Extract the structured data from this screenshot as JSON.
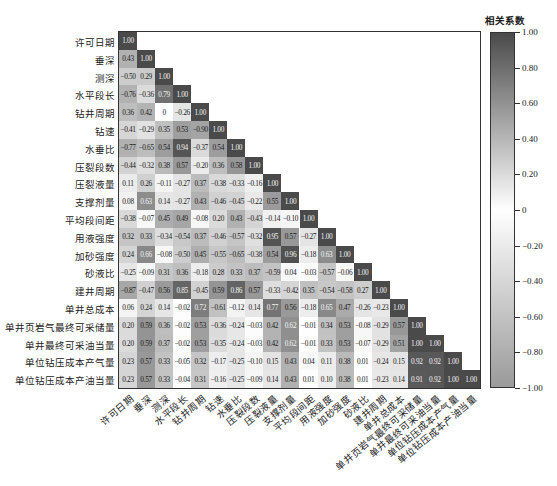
{
  "chart_data": {
    "type": "heatmap",
    "title": "",
    "colorbar_label": "相关系数",
    "colorbar_ticks": [
      "1.00",
      "0.80",
      "0.60",
      "0.40",
      "0.20",
      "0",
      "-0.20",
      "-0.40",
      "-0.60",
      "-0.80",
      "-1.00"
    ],
    "vmin": -1.0,
    "vmax": 1.0,
    "triangle": "lower",
    "variables": [
      "许可日期",
      "垂深",
      "测深",
      "水平段长",
      "钻井周期",
      "钻速",
      "水垂比",
      "压裂段数",
      "压裂液量",
      "支撑剂量",
      "平均段间距",
      "用液强度",
      "加砂强度",
      "砂液比",
      "建井周期",
      "单井总成本",
      "单井页岩气最终可采储量",
      "单井最终可采油当量",
      "单位钻压成本产气量",
      "单位钻压成本产油当量"
    ],
    "matrix": [
      [
        1.0
      ],
      [
        0.43,
        1.0
      ],
      [
        -0.5,
        0.29,
        1.0
      ],
      [
        -0.76,
        -0.36,
        0.79,
        1.0
      ],
      [
        0.36,
        0.42,
        0,
        -0.26,
        1.0
      ],
      [
        -0.41,
        -0.29,
        0.35,
        0.53,
        -0.9,
        1.0
      ],
      [
        -0.77,
        -0.65,
        0.54,
        0.94,
        -0.37,
        0.54,
        1.0
      ],
      [
        -0.44,
        -0.32,
        0.38,
        0.57,
        -0.2,
        0.36,
        0.58,
        1.0
      ],
      [
        0.11,
        0.26,
        -0.11,
        -0.27,
        0.37,
        -0.38,
        -0.33,
        -0.16,
        1.0
      ],
      [
        0.08,
        0.63,
        0.14,
        -0.27,
        0.43,
        -0.46,
        -0.45,
        -0.22,
        0.55,
        1.0
      ],
      [
        -0.38,
        -0.07,
        0.45,
        0.49,
        -0.08,
        0.2,
        0.43,
        -0.43,
        -0.14,
        -0.1,
        1.0
      ],
      [
        0.32,
        0.33,
        -0.34,
        -0.54,
        0.37,
        -0.46,
        -0.57,
        -0.32,
        0.95,
        0.57,
        -0.27,
        1.0
      ],
      [
        0.24,
        0.66,
        -0.08,
        -0.5,
        0.45,
        -0.55,
        -0.65,
        -0.38,
        0.54,
        0.96,
        -0.18,
        0.63,
        1.0
      ],
      [
        -0.25,
        -0.09,
        0.31,
        0.36,
        -0.18,
        0.28,
        0.33,
        0.37,
        -0.59,
        0.04,
        -0.03,
        -0.57,
        -0.06,
        1.0
      ],
      [
        -0.87,
        -0.47,
        0.56,
        0.85,
        -0.45,
        0.59,
        0.86,
        0.57,
        -0.33,
        -0.42,
        0.35,
        -0.54,
        -0.58,
        0.27,
        1.0
      ],
      [
        0.06,
        0.24,
        0.14,
        -0.02,
        0.72,
        -0.61,
        -0.12,
        0.14,
        0.77,
        0.56,
        -0.18,
        0.65,
        0.47,
        -0.26,
        -0.23,
        1.0
      ],
      [
        0.2,
        0.59,
        0.36,
        -0.02,
        0.53,
        -0.36,
        -0.24,
        -0.03,
        0.42,
        0.62,
        -0.01,
        0.34,
        0.53,
        -0.08,
        -0.29,
        0.57,
        1.0
      ],
      [
        0.2,
        0.59,
        0.37,
        -0.02,
        0.53,
        -0.35,
        -0.24,
        -0.03,
        0.42,
        0.62,
        -0.01,
        0.33,
        0.53,
        -0.07,
        -0.29,
        0.51,
        1.0,
        1.0
      ],
      [
        0.23,
        0.57,
        0.33,
        -0.05,
        0.32,
        -0.17,
        -0.25,
        -0.1,
        0.15,
        0.43,
        0.04,
        0.11,
        0.38,
        0.01,
        -0.24,
        0.15,
        0.92,
        0.92,
        1.0
      ],
      [
        0.23,
        0.57,
        0.33,
        -0.04,
        0.31,
        -0.16,
        -0.25,
        -0.09,
        0.14,
        0.43,
        0.01,
        0.1,
        0.38,
        0.01,
        -0.23,
        0.14,
        0.91,
        0.92,
        1.0,
        1.0
      ]
    ],
    "colors": {
      "positive_max": "#4a4a4a",
      "zero": "#ffffff",
      "negative_max": "#9a9a9a",
      "frame": "#333333"
    },
    "grid": false,
    "legend_position": "right"
  }
}
